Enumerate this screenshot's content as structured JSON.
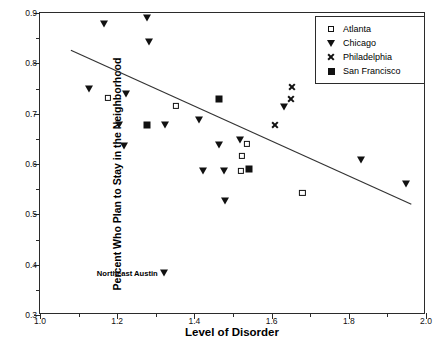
{
  "chart_data": {
    "type": "scatter",
    "title": "",
    "xlabel": "Level of Disorder",
    "ylabel": "Percent Who Plan to Stay in the Neighborhood",
    "xlim": [
      1.0,
      2.0
    ],
    "ylim": [
      0.3,
      0.9
    ],
    "xticks": [
      "1.0",
      "1.2",
      "1.4",
      "1.6",
      "1.8",
      "2.0"
    ],
    "xtick_values": [
      1.0,
      1.2,
      1.4,
      1.6,
      1.8,
      2.0
    ],
    "xminor_values": [
      1.1,
      1.3,
      1.5,
      1.7,
      1.9
    ],
    "yticks": [
      "0.3",
      "0.4",
      "0.5",
      "0.6",
      "0.7",
      "0.8",
      "0.9"
    ],
    "ytick_values": [
      0.3,
      0.4,
      0.5,
      0.6,
      0.7,
      0.8,
      0.9
    ],
    "yminor_values": [
      0.35,
      0.45,
      0.55,
      0.65,
      0.75,
      0.85
    ],
    "grid": false,
    "legend_position": "top-right",
    "marker_color": "#111111",
    "series": [
      {
        "name": "Atlanta",
        "marker": "open-square",
        "points": [
          [
            1.175,
            0.731
          ],
          [
            1.352,
            0.715
          ],
          [
            1.535,
            0.64
          ],
          [
            1.523,
            0.616
          ],
          [
            1.521,
            0.586
          ],
          [
            1.68,
            0.542
          ]
        ]
      },
      {
        "name": "Chicago",
        "marker": "filled-triangle-down",
        "points": [
          [
            1.165,
            0.878
          ],
          [
            1.278,
            0.89
          ],
          [
            1.282,
            0.842
          ],
          [
            1.128,
            0.75
          ],
          [
            1.222,
            0.739
          ],
          [
            1.205,
            0.677
          ],
          [
            1.325,
            0.677
          ],
          [
            1.218,
            0.635
          ],
          [
            1.412,
            0.688
          ],
          [
            1.463,
            0.637
          ],
          [
            1.518,
            0.647
          ],
          [
            1.423,
            0.586
          ],
          [
            1.477,
            0.586
          ],
          [
            1.478,
            0.526
          ],
          [
            1.632,
            0.713
          ],
          [
            1.832,
            0.608
          ],
          [
            1.948,
            0.561
          ],
          [
            1.322,
            0.383
          ]
        ]
      },
      {
        "name": "Philadelphia",
        "marker": "x",
        "points": [
          [
            1.652,
            0.752
          ],
          [
            1.65,
            0.729
          ],
          [
            1.608,
            0.677
          ]
        ]
      },
      {
        "name": "San Francisco",
        "marker": "filled-square",
        "points": [
          [
            1.278,
            0.677
          ],
          [
            1.465,
            0.73
          ],
          [
            1.542,
            0.591
          ]
        ]
      }
    ],
    "trend_line": {
      "x_start": 1.08,
      "y_start": 0.826,
      "x_end": 1.962,
      "y_end": 0.52,
      "color": "#333333"
    },
    "annotations": [
      {
        "text": "Northeast Austin",
        "x": 1.305,
        "y": 0.383
      }
    ]
  },
  "legend": {
    "items": [
      {
        "label": "Atlanta",
        "marker": "open-square"
      },
      {
        "label": "Chicago",
        "marker": "filled-triangle-down"
      },
      {
        "label": "Philadelphia",
        "marker": "x"
      },
      {
        "label": "San Francisco",
        "marker": "filled-square"
      }
    ]
  }
}
